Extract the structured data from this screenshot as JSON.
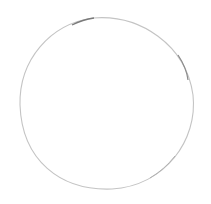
{
  "drawing": {
    "subject": "hand-drawn circle",
    "background": "#ffffff",
    "stroke_color": "#9a9a9a",
    "stroke_dark": "#6e6e6e",
    "stroke_light": "#c8c8c8",
    "circle": {
      "cx": 107,
      "cy": 103,
      "rx": 87,
      "ry": 86
    }
  }
}
